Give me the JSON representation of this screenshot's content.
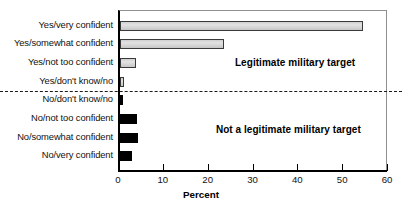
{
  "chart_data": {
    "type": "bar",
    "orientation": "horizontal",
    "title": "",
    "subtitle": "",
    "xlabel": "Percent",
    "ylabel": "",
    "xlim": [
      0,
      60
    ],
    "ylim": [
      0,
      9
    ],
    "grid": false,
    "legend": "none",
    "xticks": [
      0,
      10,
      20,
      30,
      40,
      50,
      60
    ],
    "xtick_labels": [
      "0",
      "10",
      "20",
      "30",
      "40",
      "50",
      "60"
    ],
    "categories": [
      "Yes/very confident",
      "Yes/somewhat confident",
      "Yes/not too confident",
      "Yes/don't know/no",
      "No/don't know/no",
      "No/not too confident",
      "No/somewhat confident",
      "No/very confident"
    ],
    "values": [
      54.2,
      23.2,
      3.5,
      1.0,
      0.6,
      3.8,
      4.0,
      2.7
    ],
    "bar_colors": [
      "#d8d8d8",
      "#d8d8d8",
      "#d8d8d8",
      "#d8d8d8",
      "#000000",
      "#000000",
      "#000000",
      "#000000"
    ],
    "annotations": [
      {
        "text": "Legitimate military target",
        "x": 39.5,
        "y_index": 2.0
      },
      {
        "text": "Not a legitimate military target",
        "x": 38.0,
        "y_index": 5.6
      }
    ],
    "reference_lines": [
      {
        "orientation": "horizontal",
        "style": "dashed",
        "y_index": 3.55,
        "color": "#1a1a1a"
      }
    ]
  },
  "colors": {
    "light_bar": "#d8d8d8",
    "dark_bar": "#000000",
    "axis": "#000000",
    "frame": "#8f8f8f",
    "text": "#111111"
  }
}
